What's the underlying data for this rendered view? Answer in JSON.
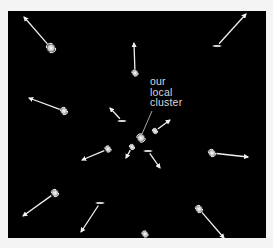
{
  "figure": {
    "background": "#000000",
    "page_background": "#f4f4f4",
    "arrow_color": "#f0f0f0",
    "frame": {
      "x": 8,
      "y": 11,
      "width": 258,
      "height": 227
    }
  },
  "label": {
    "lines": [
      "our",
      "local",
      "cluster"
    ],
    "x": 150,
    "y": 76,
    "pointer": {
      "x1": 152,
      "y1": 111,
      "x2": 142,
      "y2": 134
    }
  },
  "local_cluster": {
    "name": "our local cluster",
    "x": 141,
    "y": 138,
    "r": 4
  },
  "galaxies": [
    {
      "id": "g1",
      "type": "spiral",
      "x": 51,
      "y": 48,
      "r": 4.5,
      "arrow": {
        "x2": 24,
        "y2": 17
      }
    },
    {
      "id": "g2",
      "type": "spiral",
      "x": 135,
      "y": 73,
      "r": 3,
      "arrow": {
        "x2": 134,
        "y2": 43
      }
    },
    {
      "id": "g3",
      "type": "edge-on",
      "x": 217,
      "y": 46,
      "r": 2,
      "arrow": {
        "x2": 246,
        "y2": 14
      }
    },
    {
      "id": "g4",
      "type": "spiral",
      "x": 64,
      "y": 111,
      "r": 3.5,
      "arrow": {
        "x2": 29,
        "y2": 98
      }
    },
    {
      "id": "g5",
      "type": "edge-on",
      "x": 122,
      "y": 121,
      "r": 2,
      "arrow": {
        "x2": 110,
        "y2": 108
      }
    },
    {
      "id": "g6",
      "type": "spiral",
      "x": 155,
      "y": 131,
      "r": 2.5,
      "arrow": {
        "x2": 170,
        "y2": 120
      }
    },
    {
      "id": "g7",
      "type": "spiral",
      "x": 108,
      "y": 149,
      "r": 3,
      "arrow": {
        "x2": 82,
        "y2": 160
      }
    },
    {
      "id": "g8",
      "type": "spiral",
      "x": 132,
      "y": 147,
      "r": 2.5,
      "arrow": {
        "x2": 126,
        "y2": 158
      }
    },
    {
      "id": "g9",
      "type": "edge-on",
      "x": 148,
      "y": 151,
      "r": 2,
      "arrow": {
        "x2": 160,
        "y2": 168
      }
    },
    {
      "id": "g10",
      "type": "spiral",
      "x": 212,
      "y": 153,
      "r": 3.5,
      "arrow": {
        "x2": 248,
        "y2": 157
      }
    },
    {
      "id": "g11",
      "type": "spiral",
      "x": 55,
      "y": 193,
      "r": 3.5,
      "arrow": {
        "x2": 23,
        "y2": 216
      }
    },
    {
      "id": "g12",
      "type": "edge-on",
      "x": 100,
      "y": 203,
      "r": 2,
      "arrow": {
        "x2": 81,
        "y2": 232
      }
    },
    {
      "id": "g13",
      "type": "spiral",
      "x": 199,
      "y": 209,
      "r": 3.5,
      "arrow": {
        "x2": 224,
        "y2": 238
      }
    },
    {
      "id": "g14",
      "type": "spiral",
      "x": 145,
      "y": 234,
      "r": 3,
      "arrow": null
    }
  ]
}
